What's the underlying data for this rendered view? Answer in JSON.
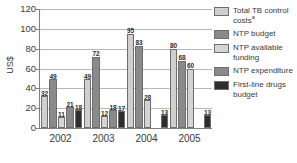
{
  "chart_data": {
    "type": "bar",
    "title": "",
    "subtitle": "",
    "xlabel": "",
    "ylabel": "US$",
    "ylim": [
      0,
      120
    ],
    "yticks": [
      0,
      20,
      40,
      60,
      80,
      100,
      120
    ],
    "grid": true,
    "legend_position": "right",
    "categories": [
      "2002",
      "2003",
      "2004",
      "2005"
    ],
    "series": [
      {
        "name": "Total TB control costs",
        "name_superscript": "a",
        "color": "#cfcfcf",
        "values": [
          32,
          49,
          95,
          80
        ]
      },
      {
        "name": "NTP budget",
        "color": "#8a8a8a",
        "values": [
          49,
          72,
          83,
          68
        ]
      },
      {
        "name": "NTP available funding",
        "color": "#d4d4d4",
        "values": [
          11,
          12,
          28,
          60
        ]
      },
      {
        "name": "NTP expenditure",
        "color": "#8a8a8a",
        "values": [
          21,
          18,
          null,
          null
        ]
      },
      {
        "name": "First-line drugs budget",
        "color": "#2e2e2e",
        "values": [
          18,
          17,
          13,
          13
        ]
      }
    ],
    "series_order_note": "Five bars per year; NTP expenditure absent for 2004 and 2005"
  },
  "axes": {
    "y_title": "US$",
    "y_ticks": [
      "0",
      "20",
      "40",
      "60",
      "80",
      "100",
      "120"
    ],
    "x_ticks": [
      "2002",
      "2003",
      "2004",
      "2005"
    ]
  },
  "legend": {
    "items": [
      {
        "label": "Total TB control costs",
        "superscript": "a",
        "swatch": "#cfcfcf"
      },
      {
        "label": "NTP budget",
        "superscript": "",
        "swatch": "#8a8a8a"
      },
      {
        "label": "NTP available funding",
        "superscript": "",
        "swatch": "#d4d4d4"
      },
      {
        "label": "NTP expenditure",
        "superscript": "",
        "swatch": "#8a8a8a"
      },
      {
        "label": "First-line drugs budget",
        "superscript": "",
        "swatch": "#2e2e2e"
      }
    ]
  },
  "colors": {
    "axis": "#808080",
    "grid": "#b8b8b8",
    "text": "#3a3a3a",
    "value_label": "#2b2b2b",
    "background": "#ffffff"
  }
}
